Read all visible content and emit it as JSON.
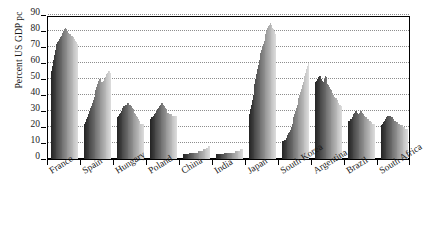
{
  "chart_data": {
    "type": "bar",
    "title": "",
    "subtitle": "",
    "xlabel": "",
    "ylabel": "Percent US GDP pc",
    "ylim": [
      0,
      90
    ],
    "ytick_step": 10,
    "yticks": [
      0,
      10,
      20,
      30,
      40,
      50,
      60,
      70,
      80,
      90
    ],
    "grid": true,
    "legend": "none",
    "orientation": "vertical",
    "bar_style": "grouped-dense-timeseries-grayscale",
    "note": "Each country group contains a dense run of thin bars shaded from dark grey (earliest) to light grey (latest), representing a per-country time series of GDP per capita as a percent of the US level.",
    "categories": [
      "France",
      "Spain",
      "Hungary",
      "Poland",
      "China",
      "India",
      "Japan",
      "South Korea",
      "Argentina",
      "Brazil",
      "South Africa"
    ],
    "groups": [
      {
        "name": "France",
        "values": [
          55,
          58,
          62,
          65,
          68,
          70,
          72,
          73,
          74,
          75,
          76,
          77,
          78,
          79,
          80,
          81,
          82,
          81,
          80,
          79,
          79,
          78,
          78,
          77,
          77,
          76,
          76,
          75,
          74,
          73,
          72
        ]
      },
      {
        "name": "Spain",
        "values": [
          22,
          23,
          25,
          26,
          28,
          29,
          30,
          32,
          33,
          35,
          37,
          39,
          41,
          43,
          45,
          47,
          49,
          50,
          50,
          49,
          48,
          48,
          49,
          50,
          51,
          52,
          53,
          54,
          55,
          55,
          54
        ]
      },
      {
        "name": "Hungary",
        "values": [
          26,
          27,
          28,
          29,
          30,
          31,
          32,
          33,
          33,
          34,
          34,
          35,
          35,
          35,
          34,
          34,
          33,
          32,
          31,
          30,
          29,
          28,
          27,
          26,
          25,
          24,
          23,
          22,
          22,
          22,
          22
        ]
      },
      {
        "name": "Poland",
        "values": [
          25,
          26,
          26,
          27,
          28,
          28,
          29,
          30,
          31,
          32,
          33,
          34,
          34,
          35,
          35,
          34,
          33,
          32,
          31,
          30,
          29,
          29,
          28,
          28,
          28,
          27,
          27,
          27,
          27,
          27,
          27
        ]
      },
      {
        "name": "China",
        "values": [
          3,
          3,
          3,
          3,
          3,
          3,
          3,
          4,
          4,
          4,
          4,
          4,
          4,
          4,
          4,
          4,
          4,
          5,
          5,
          5,
          5,
          5,
          5,
          6,
          6,
          6,
          6,
          7,
          7,
          8,
          8
        ]
      },
      {
        "name": "India",
        "values": [
          3,
          3,
          3,
          3,
          3,
          3,
          3,
          3,
          3,
          4,
          4,
          4,
          4,
          4,
          4,
          4,
          4,
          4,
          4,
          4,
          4,
          4,
          5,
          5,
          5,
          5,
          5,
          5,
          6,
          6,
          6
        ]
      },
      {
        "name": "Japan",
        "values": [
          28,
          31,
          34,
          37,
          40,
          44,
          47,
          50,
          53,
          56,
          59,
          62,
          64,
          66,
          68,
          70,
          72,
          74,
          76,
          78,
          80,
          82,
          83,
          84,
          85,
          84,
          83,
          82,
          81,
          80,
          78
        ]
      },
      {
        "name": "South Korea",
        "values": [
          11,
          11,
          12,
          12,
          13,
          14,
          15,
          16,
          17,
          18,
          20,
          22,
          24,
          26,
          28,
          30,
          32,
          34,
          36,
          38,
          40,
          42,
          44,
          46,
          48,
          50,
          52,
          54,
          56,
          58,
          60
        ]
      },
      {
        "name": "Argentina",
        "values": [
          48,
          49,
          50,
          51,
          52,
          52,
          51,
          50,
          49,
          48,
          50,
          52,
          51,
          49,
          47,
          46,
          45,
          44,
          43,
          42,
          41,
          40,
          39,
          38,
          38,
          37,
          36,
          35,
          34,
          34,
          33
        ]
      },
      {
        "name": "Brazil",
        "values": [
          24,
          24,
          25,
          25,
          26,
          27,
          28,
          29,
          30,
          30,
          29,
          28,
          28,
          29,
          30,
          30,
          29,
          28,
          27,
          27,
          26,
          26,
          25,
          25,
          24,
          24,
          23,
          23,
          22,
          22,
          22
        ]
      },
      {
        "name": "South Africa",
        "values": [
          21,
          22,
          23,
          24,
          25,
          25,
          26,
          27,
          27,
          27,
          27,
          26,
          26,
          25,
          25,
          24,
          24,
          23,
          23,
          22,
          22,
          22,
          21,
          21,
          21,
          20,
          20,
          20,
          19,
          19,
          19
        ]
      }
    ]
  }
}
